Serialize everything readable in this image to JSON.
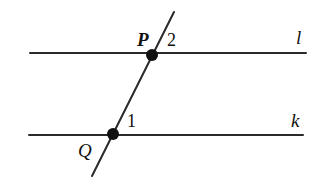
{
  "diagram": {
    "type": "parallel-lines-with-transversal",
    "lines": [
      {
        "id": "l",
        "label": "l",
        "x1": 30,
        "y1": 53,
        "x2": 306,
        "y2": 53
      },
      {
        "id": "k",
        "label": "k",
        "x1": 29,
        "y1": 135,
        "x2": 303,
        "y2": 135
      }
    ],
    "transversal": {
      "x1": 174,
      "y1": 12,
      "x2": 92,
      "y2": 176
    },
    "points": [
      {
        "id": "P",
        "label": "P",
        "x": 152,
        "y": 55
      },
      {
        "id": "Q",
        "label": "Q",
        "x": 113,
        "y": 134
      }
    ],
    "angles": [
      {
        "id": "angle-2",
        "label": "2",
        "at": "P"
      },
      {
        "id": "angle-1",
        "label": "1",
        "at": "Q"
      }
    ],
    "colors": {
      "stroke": "#2a2a2a",
      "point": "#111111",
      "background": "#ffffff"
    }
  }
}
